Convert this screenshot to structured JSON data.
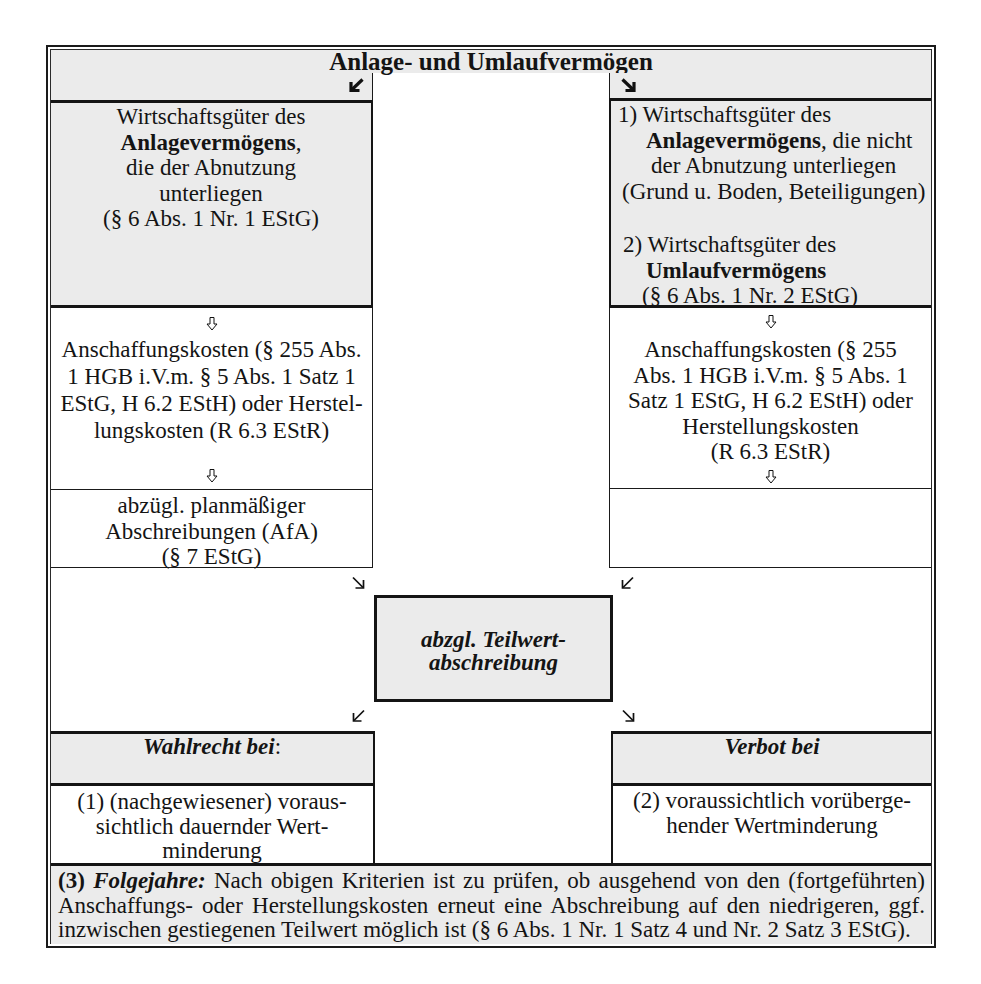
{
  "title": "Anlage- und Umlaufvermögen",
  "colors": {
    "box_fill": "#ebebeb",
    "border": "#141414",
    "background": "#ffffff"
  },
  "icons": {
    "header_left": "arrow-down-left-bold-icon",
    "header_right": "arrow-down-right-bold-icon",
    "flow_down": "hollow-arrow-down-icon",
    "to_center_left": "arrow-down-right-icon",
    "to_center_right": "arrow-down-left-icon",
    "from_center_left": "arrow-down-left-icon",
    "from_center_right": "arrow-down-right-icon"
  },
  "left": {
    "asset_box": {
      "line1": "Wirtschaftsgüter des",
      "line2_bold": "Anlagevermögens",
      "line2_rest": ",",
      "line3": "die der Abnutzung",
      "line4": "unterliegen",
      "line5": "(§ 6 Abs. 1 Nr. 1 EStG)"
    },
    "cost_box": {
      "lines": [
        "Anschaffungskosten (§ 255 Abs.",
        "1 HGB i.V.m. § 5 Abs. 1 Satz 1",
        "EStG, H 6.2 EStH) oder Herstel-",
        "lungskosten (R 6.3 EStR)"
      ]
    },
    "depreciation_box": {
      "lines": [
        "abzügl. planmäßiger",
        "Abschreibungen (AfA)",
        "(§ 7 EStG)"
      ]
    }
  },
  "right": {
    "asset_box": {
      "item1": {
        "line1": "1) Wirtschaftsgüter des",
        "line2_bold": "Anlagevermögens",
        "line2_rest": ", die nicht",
        "line3": "der Abnutzung unterliegen",
        "line4": "(Grund u. Boden, Beteiligungen)"
      },
      "item2": {
        "line1": "2) Wirtschaftsgüter des",
        "line2_bold": "Umlaufvermögens",
        "line3": "(§ 6 Abs. 1 Nr. 2 EStG)"
      }
    },
    "cost_box": {
      "lines": [
        "Anschaffungskosten (§ 255",
        "Abs. 1 HGB i.V.m. § 5 Abs. 1",
        "Satz 1 EStG, H 6.2 EStH) oder",
        "Herstellungskosten",
        "(R 6.3 EStR)"
      ]
    }
  },
  "center": {
    "lines": [
      "abzgl. Teilwert-",
      "abschreibung"
    ]
  },
  "option": {
    "heading": "Wahlrecht bei",
    "heading_suffix": ":",
    "lines": [
      "(1) (nachgewiesener) voraus-",
      "sichtlich dauernder Wert-",
      "minderung"
    ]
  },
  "prohibition": {
    "heading": "Verbot bei",
    "lines": [
      "(2) voraussichtlich vorüberge-",
      "hender Wertminderung"
    ]
  },
  "footer": {
    "number": "(3)",
    "label": "Folgejahre:",
    "line1_rest": "Nach obigen Kriterien ist zu prüfen, ob ausgehend von den (fortgeführten)",
    "line2": "Anschaffungs- oder Herstellungskosten erneut eine Abschreibung auf den niedrigeren, ggf.",
    "line3": "inzwischen gestiegenen Teilwert möglich ist (§ 6 Abs. 1 Nr. 1 Satz 4 und Nr. 2 Satz 3 EStG)."
  }
}
